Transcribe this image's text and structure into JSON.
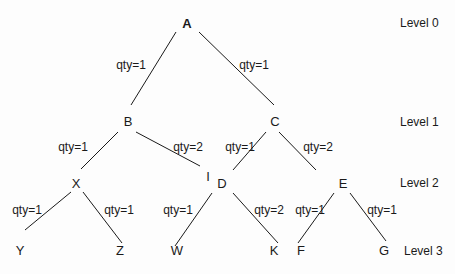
{
  "levels": [
    "Level 0",
    "Level 1",
    "Level 2",
    "Level 3"
  ],
  "nodes": [
    {
      "id": "A",
      "label": "A",
      "level": 0
    },
    {
      "id": "B",
      "label": "B",
      "level": 1
    },
    {
      "id": "C",
      "label": "C",
      "level": 1
    },
    {
      "id": "X",
      "label": "X",
      "level": 2
    },
    {
      "id": "I",
      "label": "I",
      "level": 2
    },
    {
      "id": "D",
      "label": "D",
      "level": 2
    },
    {
      "id": "E",
      "label": "E",
      "level": 2
    },
    {
      "id": "Y",
      "label": "Y",
      "level": 3
    },
    {
      "id": "Z",
      "label": "Z",
      "level": 3
    },
    {
      "id": "W",
      "label": "W",
      "level": 3
    },
    {
      "id": "K",
      "label": "K",
      "level": 3
    },
    {
      "id": "F",
      "label": "F",
      "level": 3
    },
    {
      "id": "G",
      "label": "G",
      "level": 3
    }
  ],
  "edges": [
    {
      "from": "A",
      "to": "B",
      "label": "qty=1"
    },
    {
      "from": "A",
      "to": "C",
      "label": "qty=1"
    },
    {
      "from": "B",
      "to": "X",
      "label": "qty=1"
    },
    {
      "from": "B",
      "to": "I",
      "label": "qty=2"
    },
    {
      "from": "C",
      "to": "D",
      "label": "qty=1"
    },
    {
      "from": "C",
      "to": "E",
      "label": "qty=2"
    },
    {
      "from": "X",
      "to": "Y",
      "label": "qty=1"
    },
    {
      "from": "X",
      "to": "Z",
      "label": "qty=1"
    },
    {
      "from": "D",
      "to": "W",
      "label": "qty=1"
    },
    {
      "from": "D",
      "to": "K",
      "label": "qty=2"
    },
    {
      "from": "E",
      "to": "F",
      "label": "qty=1"
    },
    {
      "from": "E",
      "to": "G",
      "label": "qty=1"
    }
  ]
}
